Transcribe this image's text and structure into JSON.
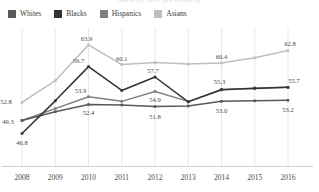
{
  "title_clipped": "Share by race and ethnicity",
  "legend": {
    "items": [
      {
        "label": "Whites",
        "color": "#595959"
      },
      {
        "label": "Blacks",
        "color": "#333333"
      },
      {
        "label": "Hispanics",
        "color": "#808080"
      },
      {
        "label": "Asians",
        "color": "#bfbfbf"
      }
    ]
  },
  "chart_data": {
    "type": "line",
    "title": "",
    "xlabel": "",
    "ylabel": "",
    "categories": [
      "2008",
      "2009",
      "2010",
      "2011",
      "2012",
      "2013",
      "2014",
      "2015",
      "2016"
    ],
    "ylim": [
      44,
      66
    ],
    "grid": "vertical",
    "legend_position": "top-left",
    "series": [
      {
        "name": "Whites",
        "color": "#595959",
        "values": [
          49.3,
          51.0,
          52.4,
          52.3,
          52.0,
          52.1,
          53.0,
          53.1,
          53.2
        ],
        "labels": [
          {
            "x": "2008",
            "value": 49.3,
            "text": "49.3"
          },
          {
            "x": "2010",
            "value": 52.4,
            "text": "52.4"
          },
          {
            "x": "2012",
            "value": 51.8,
            "text": "51.8"
          },
          {
            "x": "2014",
            "value": 53.0,
            "text": "53.0"
          },
          {
            "x": "2016",
            "value": 53.2,
            "text": "53.2"
          }
        ]
      },
      {
        "name": "Blacks",
        "color": "#333333",
        "values": [
          46.8,
          53.1,
          59.7,
          55.1,
          57.7,
          52.9,
          55.3,
          55.5,
          55.7
        ],
        "labels": [
          {
            "x": "2008",
            "value": 46.8,
            "text": "46.8"
          },
          {
            "x": "2010",
            "value": 59.7,
            "text": "59.7"
          },
          {
            "x": "2012",
            "value": 57.7,
            "text": "57.7"
          },
          {
            "x": "2014",
            "value": 55.3,
            "text": "55.3"
          },
          {
            "x": "2016",
            "value": 55.7,
            "text": "55.7"
          }
        ]
      },
      {
        "name": "Hispanics",
        "color": "#808080",
        "values": [
          49.3,
          51.6,
          53.9,
          53.0,
          54.9,
          53.0,
          55.2,
          55.6,
          55.7
        ],
        "labels": [
          {
            "x": "2010",
            "value": 53.9,
            "text": "53.9"
          },
          {
            "x": "2012",
            "value": 54.9,
            "text": "54.9"
          }
        ]
      },
      {
        "name": "Asians",
        "color": "#bfbfbf",
        "values": [
          52.8,
          57.0,
          63.9,
          60.1,
          60.5,
          60.2,
          60.4,
          61.4,
          62.8
        ],
        "labels": [
          {
            "x": "2008",
            "value": 52.8,
            "text": "52.8"
          },
          {
            "x": "2010",
            "value": 63.9,
            "text": "63.9"
          },
          {
            "x": "2011",
            "value": 60.1,
            "text": "60.1"
          },
          {
            "x": "2014",
            "value": 60.4,
            "text": "60.4"
          },
          {
            "x": "2016",
            "value": 62.8,
            "text": "62.8"
          }
        ]
      }
    ],
    "label_offsets": {
      "49.3": [
        -14,
        3
      ],
      "52.4": [
        0,
        11
      ],
      "51.8": [
        0,
        11
      ],
      "53.0": [
        0,
        12
      ],
      "53.2": [
        0,
        12
      ],
      "46.8": [
        0,
        12
      ],
      "59.7": [
        -10,
        -4
      ],
      "57.7": [
        -2,
        -4
      ],
      "55.3": [
        -2,
        -5
      ],
      "55.7": [
        6,
        -4
      ],
      "53.9": [
        -8,
        -4
      ],
      "54.9": [
        0,
        10
      ],
      "52.8": [
        -16,
        2
      ],
      "63.9": [
        -2,
        -4
      ],
      "60.1": [
        0,
        -4
      ],
      "60.4": [
        0,
        -4
      ],
      "62.8": [
        2,
        -5
      ]
    }
  },
  "xaxis": {
    "ticks": [
      "2008",
      "2009",
      "2010",
      "2011",
      "2012",
      "2013",
      "2014",
      "2015",
      "2016"
    ]
  },
  "colors": {
    "gridline": "#e2e2e2",
    "axisline": "#d0d0d0",
    "text": "#4a4a4a"
  }
}
